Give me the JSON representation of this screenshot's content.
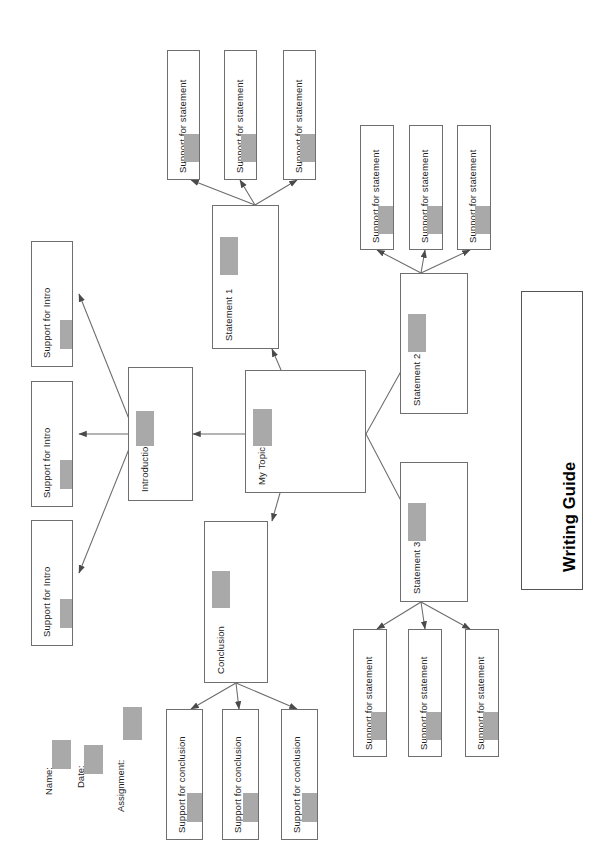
{
  "page": {
    "title": "Writing Guide",
    "orientation": "rotated-90",
    "background": "#ffffff",
    "box_border_color": "#6f6f6f",
    "swatch_color": "#a9a9a9",
    "text_color": "#1d1d1d"
  },
  "header_fields": [
    {
      "label": "Name:"
    },
    {
      "label": "Date:"
    },
    {
      "label": "Assignment:"
    }
  ],
  "center": {
    "topic": {
      "label": "My Topic"
    }
  },
  "branches": {
    "introduction": {
      "label": "Introduction",
      "supports": [
        {
          "label": "Support for Intro"
        },
        {
          "label": "Support for Intro"
        },
        {
          "label": "Support for Intro"
        }
      ]
    },
    "statement_1": {
      "label": "Statement 1",
      "supports": [
        {
          "label": "Support for statement"
        },
        {
          "label": "Support for statement"
        },
        {
          "label": "Support for statement"
        }
      ]
    },
    "statement_2": {
      "label": "Statement 2",
      "supports": [
        {
          "label": "Support for statement"
        },
        {
          "label": "Support for statement"
        },
        {
          "label": "Support for statement"
        }
      ]
    },
    "statement_3": {
      "label": "Statement 3",
      "supports": [
        {
          "label": "Support for statement"
        },
        {
          "label": "Support for statement"
        },
        {
          "label": "Support for statement"
        }
      ]
    },
    "conclusion": {
      "label": "Conclusion",
      "supports": [
        {
          "label": "Support for conclusion"
        },
        {
          "label": "Support for conclusion"
        },
        {
          "label": "Support for conclusion"
        }
      ]
    }
  }
}
